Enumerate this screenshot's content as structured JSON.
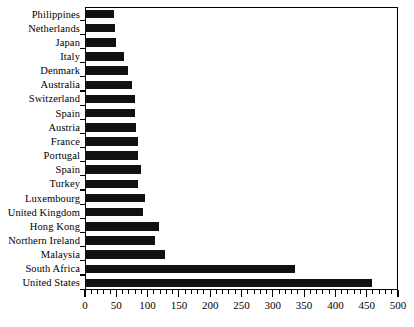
{
  "chart_data": {
    "type": "bar",
    "orientation": "horizontal",
    "title": "",
    "subtitle": "",
    "xlabel": "",
    "ylabel": "",
    "xlim": [
      0,
      500
    ],
    "ylim": null,
    "grid": false,
    "legend": null,
    "bar_color": "#111111",
    "frame_color": "#000000",
    "background": "#ffffff",
    "xticks": [
      0,
      50,
      100,
      150,
      200,
      250,
      300,
      350,
      400,
      450,
      500
    ],
    "xtick_labels": [
      "0",
      "50",
      "100",
      "150",
      "200",
      "250",
      "300",
      "350",
      "400",
      "450",
      "500"
    ],
    "xtick_minor_step": 10,
    "categories": [
      "Philippines",
      "Netherlands",
      "Japan",
      "Italy",
      "Denmark",
      "Australia",
      "Switzerland",
      "Spain",
      "Austria",
      "France",
      "Portugal",
      "Spain",
      "Turkey",
      "Luxembourg",
      "United Kingdom",
      "Hong Kong",
      "Northern Ireland",
      "Malaysia",
      "South Africa",
      "United States"
    ],
    "values": [
      46,
      48,
      50,
      62,
      69,
      75,
      80,
      80,
      81,
      85,
      85,
      89,
      84,
      96,
      92,
      119,
      112,
      127,
      335,
      458
    ]
  }
}
